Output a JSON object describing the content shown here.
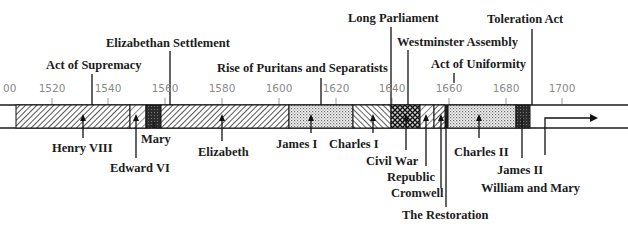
{
  "diagram": {
    "type": "timeline",
    "scale": {
      "ticks": [
        "1500",
        "1520",
        "1540",
        "1560",
        "1580",
        "1600",
        "1620",
        "1640",
        "1660",
        "1680",
        "1700"
      ],
      "first_visible_label": "00"
    },
    "events_above": [
      {
        "label": "Act of Supremacy",
        "year": "1534"
      },
      {
        "label": "Elizabethan Settlement",
        "year": "1559"
      },
      {
        "label": "Rise of Puritans and Separatists",
        "year": "1610"
      },
      {
        "label": "Long Parliament",
        "year": "1640"
      },
      {
        "label": "Westminster Assembly",
        "year": "1643"
      },
      {
        "label": "Act of Uniformity",
        "year": "1662"
      },
      {
        "label": "Toleration Act",
        "year": "1689"
      }
    ],
    "periods_below": [
      {
        "label": "Henry VIII",
        "start": "1509",
        "end": "1547"
      },
      {
        "label": "Edward VI",
        "start": "1547",
        "end": "1553"
      },
      {
        "label": "Mary",
        "start": "1553",
        "end": "1558"
      },
      {
        "label": "Elizabeth",
        "start": "1558",
        "end": "1603"
      },
      {
        "label": "James I",
        "start": "1603",
        "end": "1625"
      },
      {
        "label": "Charles I",
        "start": "1625",
        "end": "1642"
      },
      {
        "label": "Civil War",
        "start": "1642",
        "end": "1649"
      },
      {
        "label": "Republic",
        "start": "1649",
        "end": "1653"
      },
      {
        "label": "Cromwell",
        "start": "1653",
        "end": "1659"
      },
      {
        "label": "The Restoration",
        "start": "1660",
        "end": "1660"
      },
      {
        "label": "Charles II",
        "start": "1660",
        "end": "1685"
      },
      {
        "label": "James II",
        "start": "1685",
        "end": "1688"
      },
      {
        "label": "William and Mary",
        "start": "1689",
        "end": ""
      }
    ]
  }
}
